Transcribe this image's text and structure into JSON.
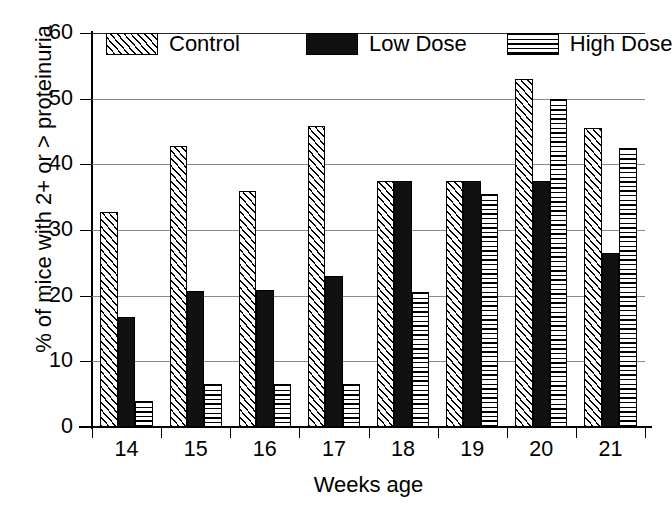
{
  "chart_data": {
    "type": "bar",
    "title": "",
    "subtitle": "",
    "xlabel": "Weeks age",
    "ylabel": "% of mice with 2+ or > proteinuria",
    "categories": [
      "14",
      "15",
      "16",
      "17",
      "18",
      "19",
      "20",
      "21"
    ],
    "series": [
      {
        "name": "Control",
        "pattern": "diagonal-hatch",
        "color": "#ffffff",
        "values": [
          32.8,
          42.8,
          36.0,
          45.8,
          37.5,
          37.5,
          53.0,
          45.5
        ]
      },
      {
        "name": "Low Dose",
        "pattern": "solid-black",
        "color": "#111111",
        "values": [
          16.7,
          20.7,
          20.8,
          23.0,
          37.5,
          37.5,
          37.5,
          26.5
        ]
      },
      {
        "name": "High Dose",
        "pattern": "horizontal-lines",
        "color": "#ffffff",
        "values": [
          4.0,
          6.5,
          6.5,
          6.5,
          20.5,
          35.5,
          50.0,
          42.5
        ]
      }
    ],
    "ylim": [
      0,
      60
    ],
    "yticks": [
      0,
      10,
      20,
      30,
      40,
      50,
      60
    ],
    "ytick_labels": [
      "0",
      "10",
      "20",
      "30",
      "40",
      "50",
      "60"
    ],
    "grid": "horizontal",
    "legend_position": "inside-top"
  },
  "axes": {
    "y_title": "% of mice with 2+ or > proteinuria",
    "x_title": "Weeks age"
  },
  "legend": {
    "items": [
      {
        "label": "Control"
      },
      {
        "label": "Low Dose"
      },
      {
        "label": "High Dose"
      }
    ]
  }
}
